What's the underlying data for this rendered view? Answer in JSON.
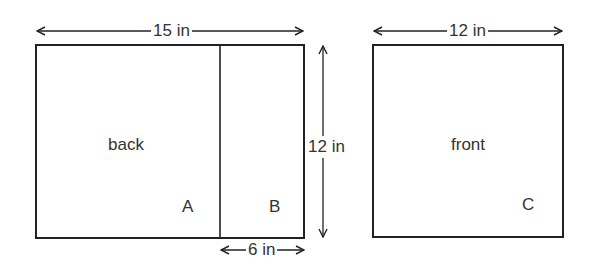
{
  "diagram": {
    "back_panel": {
      "label": "back",
      "width_label": "15 in",
      "height_label": "12 in",
      "sections": [
        {
          "id": "A",
          "label": "A"
        },
        {
          "id": "B",
          "label": "B",
          "width_label": "6 in"
        }
      ]
    },
    "front_panel": {
      "label": "front",
      "width_label": "12 in",
      "section": {
        "id": "C",
        "label": "C"
      }
    },
    "colors": {
      "line": "#222222",
      "background": "#ffffff"
    }
  }
}
